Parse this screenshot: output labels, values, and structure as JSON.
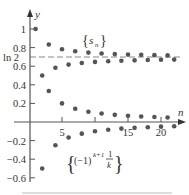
{
  "chart_data": {
    "type": "scatter",
    "title": "",
    "xlabel": "n",
    "ylabel": "y",
    "xlim": [
      0,
      23
    ],
    "ylim": [
      -0.65,
      1.1
    ],
    "grid": false,
    "x_ticks": [
      5,
      10,
      15,
      20
    ],
    "x_tick_labels": [
      "5",
      "",
      "15",
      "20"
    ],
    "y_ticks": [
      1,
      0.8,
      0.6,
      0.4,
      0.2,
      -0.2,
      -0.4,
      -0.6
    ],
    "y_tick_labels": [
      "1",
      "0.8",
      "0.6",
      "0.4",
      "0.2",
      "−0.2",
      "−0.4",
      "−0.6"
    ],
    "reference_line": {
      "label": "ln 2",
      "value": 0.6931,
      "style": "dashed"
    },
    "series": [
      {
        "name": "{s_n}",
        "x": [
          1,
          2,
          3,
          4,
          5,
          6,
          7,
          8,
          9,
          10,
          11,
          12,
          13,
          14,
          15,
          16,
          17,
          18,
          19,
          20,
          21,
          22
        ],
        "values": [
          1.0,
          0.5,
          0.833,
          0.583,
          0.783,
          0.617,
          0.76,
          0.635,
          0.746,
          0.646,
          0.737,
          0.653,
          0.73,
          0.659,
          0.725,
          0.663,
          0.722,
          0.666,
          0.719,
          0.669,
          0.716,
          0.671
        ]
      },
      {
        "name": "{(-1)^(k+1) 1/k}",
        "x": [
          1,
          2,
          3,
          4,
          5,
          6,
          7,
          8,
          9,
          10,
          11,
          12,
          13,
          14,
          15,
          16,
          17,
          18,
          19,
          20,
          21,
          22
        ],
        "values": [
          1.0,
          -0.5,
          0.333,
          -0.25,
          0.2,
          -0.167,
          0.143,
          -0.125,
          0.111,
          -0.1,
          0.091,
          -0.083,
          0.077,
          -0.071,
          0.067,
          -0.063,
          0.059,
          -0.056,
          0.053,
          -0.05,
          0.048,
          -0.045
        ]
      }
    ],
    "annotations": [
      {
        "text": "{s_n}",
        "near_series": 0
      },
      {
        "text": "{(-1)^(k+1) 1/k}",
        "near_series": 1
      }
    ]
  },
  "labels": {
    "y_axis": "y",
    "x_axis": "n",
    "ln2": "ln 2",
    "sn_brace_open": "{",
    "sn_s": "s",
    "sn_sub": "n",
    "sn_brace_close": "}",
    "term_brace_open": "{",
    "term_base": "(−1)",
    "term_exp": "k+1",
    "term_num": "1",
    "term_den": "k",
    "term_brace_close": "}"
  }
}
